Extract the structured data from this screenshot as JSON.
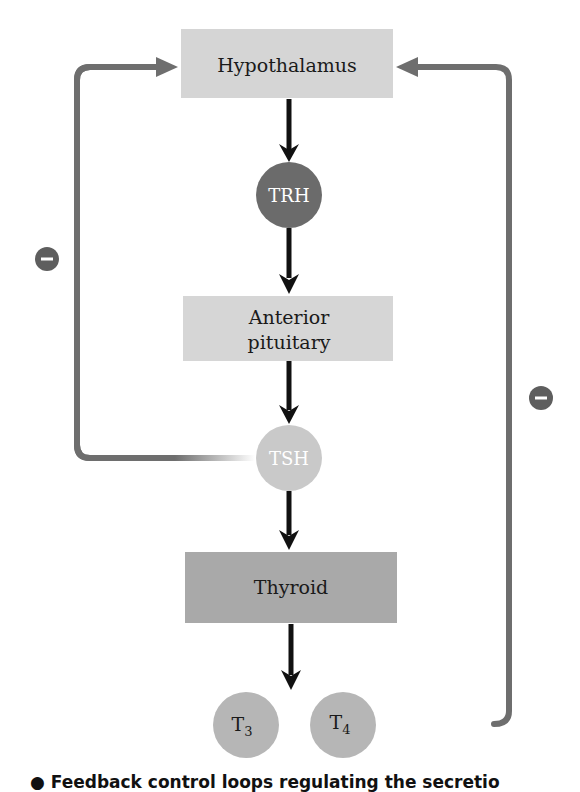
{
  "diagram": {
    "nodes": {
      "hypothalamus": {
        "label": "Hypothalamus",
        "shape": "rectangle",
        "color": "#d5d5d5"
      },
      "trh": {
        "label": "TRH",
        "shape": "circle",
        "color": "#6b6b6b"
      },
      "anterior_pituitary": {
        "label_line1": "Anterior",
        "label_line2": "pituitary",
        "shape": "rectangle",
        "color": "#d6d6d6"
      },
      "tsh": {
        "label": "TSH",
        "shape": "circle",
        "color": "#c9c9c9"
      },
      "thyroid": {
        "label": "Thyroid",
        "shape": "rectangle",
        "color": "#a9a9a9"
      },
      "t3": {
        "label_main": "T",
        "label_sub": "3",
        "shape": "circle",
        "color": "#b6b6b6"
      },
      "t4": {
        "label_main": "T",
        "label_sub": "4",
        "shape": "circle",
        "color": "#b6b6b6"
      }
    },
    "edges": [
      {
        "from": "hypothalamus",
        "to": "trh",
        "type": "stimulatory",
        "color": "#111111"
      },
      {
        "from": "trh",
        "to": "anterior_pituitary",
        "type": "stimulatory",
        "color": "#111111"
      },
      {
        "from": "anterior_pituitary",
        "to": "tsh",
        "type": "stimulatory",
        "color": "#111111"
      },
      {
        "from": "tsh",
        "to": "thyroid",
        "type": "stimulatory",
        "color": "#111111"
      },
      {
        "from": "thyroid",
        "to": "t3_t4",
        "type": "stimulatory",
        "color": "#111111"
      },
      {
        "from": "tsh",
        "to": "hypothalamus",
        "type": "negative feedback",
        "sign": "−",
        "color": "#6e6e6e"
      },
      {
        "from": "t4",
        "to": "hypothalamus",
        "type": "negative feedback",
        "sign": "−",
        "color": "#6e6e6e"
      }
    ],
    "feedback_signs": {
      "left": "−",
      "right": "−"
    }
  },
  "caption": {
    "text": "● Feedback control loops regulating the secretio"
  }
}
